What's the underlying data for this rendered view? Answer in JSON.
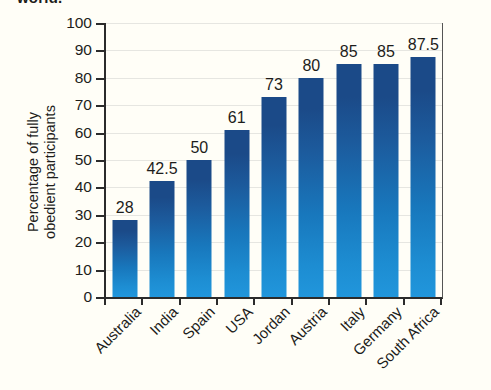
{
  "caption_remnant": "world.",
  "chart_data": {
    "type": "bar",
    "title": "",
    "xlabel": "",
    "ylabel": "Percentage of fully\nobedient participants",
    "ylim": [
      0,
      100
    ],
    "ytick_step": 10,
    "ytick_labels": [
      "0",
      "10",
      "20",
      "30",
      "40",
      "50",
      "60",
      "70",
      "80",
      "90",
      "100"
    ],
    "grid": true,
    "legend": "none",
    "bar_color_top": "#1b4a88",
    "bar_color_bottom": "#2196dc",
    "categories": [
      "Australia",
      "India",
      "Spain",
      "USA",
      "Jordan",
      "Austria",
      "Italy",
      "Germany",
      "South Africa"
    ],
    "values": [
      28,
      42.5,
      50,
      61,
      73,
      80,
      85,
      85,
      87.5
    ],
    "value_labels": [
      "28",
      "42.5",
      "50",
      "61",
      "73",
      "80",
      "85",
      "85",
      "87.5"
    ]
  }
}
